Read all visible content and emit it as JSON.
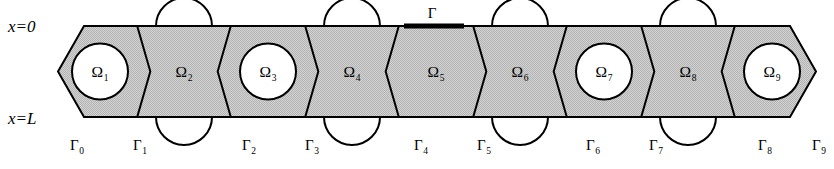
{
  "figure": {
    "type": "diagram"
  },
  "colors": {
    "fill_gray": "#c9c9c9",
    "stroke": "#000000",
    "background": "#ffffff",
    "hole_fill": "#ffffff",
    "gamma_bold": "#000000"
  },
  "geometry": {
    "strip_top_y": 26,
    "strip_bottom_y": 117,
    "left_vertex_x": 58,
    "right_vertex_x": 816,
    "cell_width": 84,
    "mid_y": 71.5,
    "circle_radius": 28,
    "hole_radius": 28,
    "stroke_width": 2
  },
  "axis_labels": [
    {
      "id": "x-zero",
      "text": "x=0",
      "x": 8,
      "y": 32
    },
    {
      "id": "x-L",
      "text": "x=L",
      "x": 8,
      "y": 124
    }
  ],
  "top_boundary": {
    "label": "Γ",
    "label_x": 432,
    "label_y": 18,
    "segment_x1": 404,
    "segment_x2": 464,
    "segment_y": 26
  },
  "cells": [
    {
      "index": 1,
      "label": "Ω",
      "subscript": "1",
      "type": "hexagon-with-circle",
      "center_x": 100,
      "label_x": 100,
      "label_y": 77
    },
    {
      "index": 2,
      "label": "Ω",
      "subscript": "2",
      "type": "bowtie-with-halfcircles",
      "center_x": 184,
      "label_x": 184,
      "label_y": 77
    },
    {
      "index": 3,
      "label": "Ω",
      "subscript": "3",
      "type": "hexagon-with-circle",
      "center_x": 268,
      "label_x": 268,
      "label_y": 77
    },
    {
      "index": 4,
      "label": "Ω",
      "subscript": "4",
      "type": "bowtie-with-halfcircles",
      "center_x": 352,
      "label_x": 352,
      "label_y": 77
    },
    {
      "index": 5,
      "label": "Ω",
      "subscript": "5",
      "type": "hexagon-plain",
      "center_x": 436,
      "label_x": 436,
      "label_y": 77
    },
    {
      "index": 6,
      "label": "Ω",
      "subscript": "6",
      "type": "bowtie-with-halfcircles",
      "center_x": 520,
      "label_x": 520,
      "label_y": 77
    },
    {
      "index": 7,
      "label": "Ω",
      "subscript": "7",
      "type": "hexagon-with-circle",
      "center_x": 604,
      "label_x": 604,
      "label_y": 77
    },
    {
      "index": 8,
      "label": "Ω",
      "subscript": "8",
      "type": "bowtie-with-halfcircles",
      "center_x": 688,
      "label_x": 688,
      "label_y": 77
    },
    {
      "index": 9,
      "label": "Ω",
      "subscript": "9",
      "type": "hexagon-with-circle",
      "center_x": 772,
      "label_x": 772,
      "label_y": 77
    }
  ],
  "interface_labels": [
    {
      "index": 0,
      "label": "Γ",
      "subscript": "0",
      "x": 77,
      "y": 150
    },
    {
      "index": 1,
      "label": "Γ",
      "subscript": "1",
      "x": 140,
      "y": 150
    },
    {
      "index": 2,
      "label": "Γ",
      "subscript": "2",
      "x": 249,
      "y": 150
    },
    {
      "index": 3,
      "label": "Γ",
      "subscript": "3",
      "x": 312,
      "y": 150
    },
    {
      "index": 4,
      "label": "Γ",
      "subscript": "4",
      "x": 421,
      "y": 150
    },
    {
      "index": 5,
      "label": "Γ",
      "subscript": "5",
      "x": 484,
      "y": 150
    },
    {
      "index": 6,
      "label": "Γ",
      "subscript": "6",
      "x": 593,
      "y": 150
    },
    {
      "index": 7,
      "label": "Γ",
      "subscript": "7",
      "x": 656,
      "y": 150
    },
    {
      "index": 8,
      "label": "Γ",
      "subscript": "8",
      "x": 765,
      "y": 150
    },
    {
      "index": 9,
      "label": "Γ",
      "subscript": "9",
      "x": 819,
      "y": 150
    }
  ]
}
